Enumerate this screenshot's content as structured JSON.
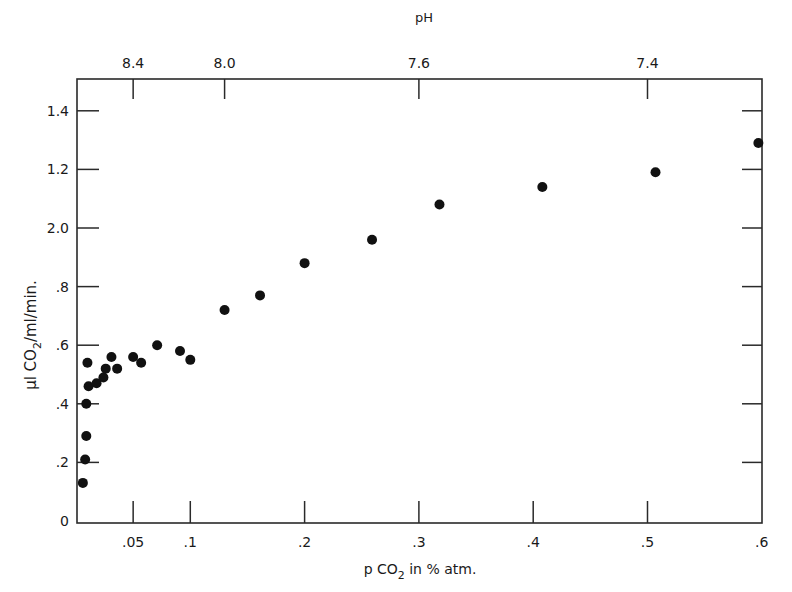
{
  "chart_data": {
    "type": "scatter",
    "title": "",
    "xlabel": "p CO2 in % atm.",
    "ylabel": "µl CO2/ml/min.",
    "top_axis_label": "pH",
    "xlim": [
      0,
      0.6
    ],
    "ylim": [
      0,
      1.5
    ],
    "grid": false,
    "legend": null,
    "x_ticks": [
      {
        "value": 0.05,
        "label": ".05"
      },
      {
        "value": 0.1,
        "label": ".1"
      },
      {
        "value": 0.2,
        "label": ".2"
      },
      {
        "value": 0.3,
        "label": ".3"
      },
      {
        "value": 0.4,
        "label": ".4"
      },
      {
        "value": 0.5,
        "label": ".5"
      },
      {
        "value": 0.6,
        "label": ".6"
      }
    ],
    "y_ticks": [
      {
        "value": 0,
        "label": "0"
      },
      {
        "value": 0.2,
        "label": ".2"
      },
      {
        "value": 0.4,
        "label": ".4"
      },
      {
        "value": 0.6,
        "label": ".6"
      },
      {
        "value": 0.8,
        "label": ".8"
      },
      {
        "value": 1.0,
        "label": "2.0"
      },
      {
        "value": 1.2,
        "label": "1.2"
      },
      {
        "value": 1.4,
        "label": "1.4"
      }
    ],
    "top_ticks": [
      {
        "x": 0.05,
        "label": "8.4"
      },
      {
        "x": 0.13,
        "label": "8.0"
      },
      {
        "x": 0.3,
        "label": "7.6"
      },
      {
        "x": 0.5,
        "label": "7.4"
      }
    ],
    "series": [
      {
        "name": "data",
        "points": [
          {
            "x": 0.006,
            "y": 0.13
          },
          {
            "x": 0.008,
            "y": 0.21
          },
          {
            "x": 0.009,
            "y": 0.29
          },
          {
            "x": 0.009,
            "y": 0.4
          },
          {
            "x": 0.01,
            "y": 0.54
          },
          {
            "x": 0.011,
            "y": 0.46
          },
          {
            "x": 0.018,
            "y": 0.47
          },
          {
            "x": 0.024,
            "y": 0.49
          },
          {
            "x": 0.026,
            "y": 0.52
          },
          {
            "x": 0.031,
            "y": 0.56
          },
          {
            "x": 0.036,
            "y": 0.52
          },
          {
            "x": 0.05,
            "y": 0.56
          },
          {
            "x": 0.057,
            "y": 0.54
          },
          {
            "x": 0.071,
            "y": 0.6
          },
          {
            "x": 0.091,
            "y": 0.58
          },
          {
            "x": 0.1,
            "y": 0.55
          },
          {
            "x": 0.13,
            "y": 0.72
          },
          {
            "x": 0.161,
            "y": 0.77
          },
          {
            "x": 0.2,
            "y": 0.88
          },
          {
            "x": 0.259,
            "y": 0.96
          },
          {
            "x": 0.318,
            "y": 1.08
          },
          {
            "x": 0.408,
            "y": 1.14
          },
          {
            "x": 0.507,
            "y": 1.19
          },
          {
            "x": 0.597,
            "y": 1.29
          }
        ]
      }
    ]
  },
  "labels": {
    "x_axis_prefix": "p CO",
    "x_axis_sub": "2",
    "x_axis_suffix": " in  % atm.",
    "y_axis_prefix": "µl CO",
    "y_axis_sub": "2",
    "y_axis_suffix": "/ml/min.",
    "top_axis": "pH"
  }
}
